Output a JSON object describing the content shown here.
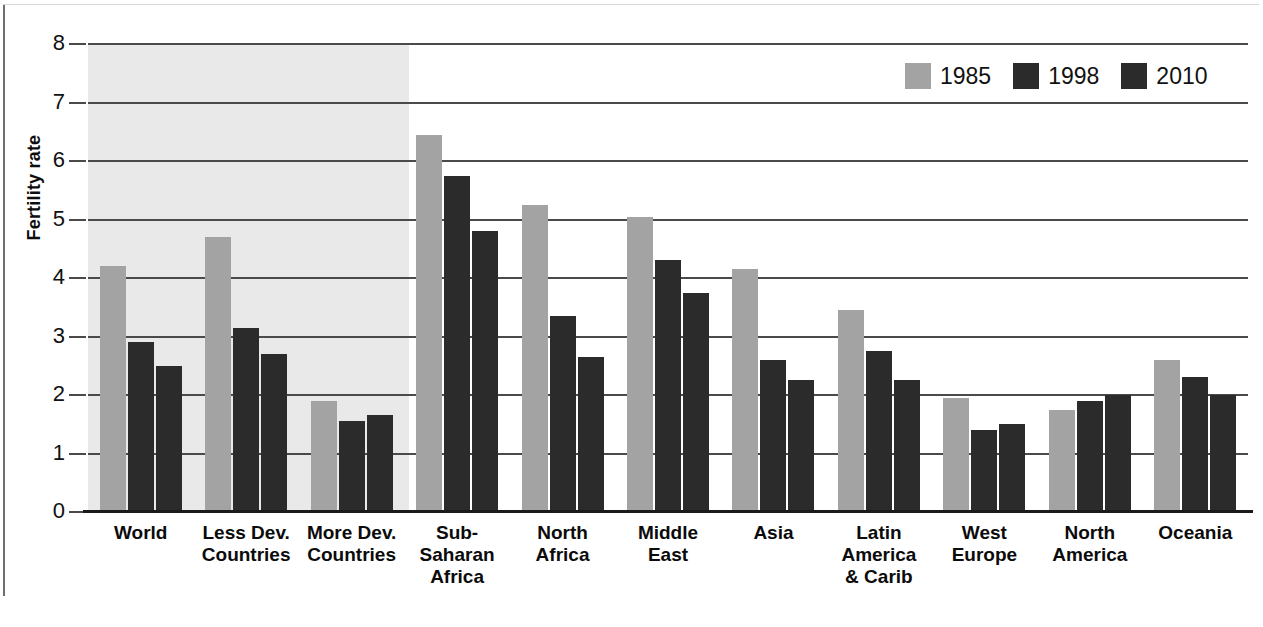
{
  "chart_data": {
    "type": "bar",
    "title": "",
    "xlabel": "",
    "ylabel": "Fertility rate",
    "ylim": [
      0,
      8
    ],
    "ytick_labels": [
      "8",
      "7",
      "6",
      "5",
      "4",
      "3",
      "2",
      "1",
      "0"
    ],
    "ytick_values": [
      8,
      7,
      6,
      5,
      4,
      3,
      2,
      1,
      0
    ],
    "grid": true,
    "legend_position": "top-right",
    "categories": [
      "World",
      "Less Dev.\nCountries",
      "More Dev.\nCountries",
      "Sub-\nSaharan\nAfrica",
      "North\nAfrica",
      "Middle\nEast",
      "Asia",
      "Latin\nAmerica\n& Carib",
      "West\nEurope",
      "North\nAmerica",
      "Oceania"
    ],
    "series": [
      {
        "name": "1985",
        "color": "#a3a3a3",
        "values": [
          4.2,
          4.7,
          1.9,
          6.45,
          5.25,
          5.05,
          4.15,
          3.45,
          1.95,
          1.75,
          2.6
        ]
      },
      {
        "name": "1998",
        "color": "#2b2b2b",
        "values": [
          2.9,
          3.15,
          1.55,
          5.75,
          3.35,
          4.3,
          2.6,
          2.75,
          1.4,
          1.9,
          2.3
        ]
      },
      {
        "name": "2010",
        "color": "#2b2b2b",
        "values": [
          2.5,
          2.7,
          1.65,
          4.8,
          2.65,
          3.75,
          2.25,
          2.25,
          1.5,
          2.0,
          2.0
        ]
      }
    ],
    "shaded_region": {
      "label": "aggregate-groups-shading",
      "covers_categories": [
        "World",
        "Less Dev. Countries",
        "More Dev. Countries"
      ],
      "color": "#e9e9e9"
    }
  },
  "legend": {
    "items": [
      {
        "label": "1985",
        "color": "#a3a3a3"
      },
      {
        "label": "1998",
        "color": "#2b2b2b"
      },
      {
        "label": "2010",
        "color": "#2b2b2b"
      }
    ]
  },
  "axis": {
    "y_title": "Fertility rate"
  }
}
